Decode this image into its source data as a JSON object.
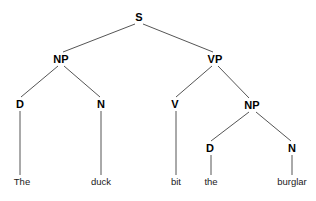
{
  "figure": {
    "kind": "constituency-parse-tree",
    "sentence": "The duck bit the burglar",
    "background_color": "#ffffff",
    "edge_color": "#555555",
    "node_text_color": "#000000",
    "leaf_text_color": "#1a1a1a"
  },
  "nodes": [
    {
      "id": "s",
      "label": "S",
      "x": 139,
      "y": 17
    },
    {
      "id": "np1",
      "label": "NP",
      "x": 61,
      "y": 59
    },
    {
      "id": "vp",
      "label": "VP",
      "x": 215,
      "y": 59
    },
    {
      "id": "d1",
      "label": "D",
      "x": 20,
      "y": 104
    },
    {
      "id": "n1",
      "label": "N",
      "x": 101,
      "y": 104
    },
    {
      "id": "v",
      "label": "V",
      "x": 175,
      "y": 104
    },
    {
      "id": "np2",
      "label": "NP",
      "x": 252,
      "y": 105
    },
    {
      "id": "d2",
      "label": "D",
      "x": 210,
      "y": 148
    },
    {
      "id": "n2",
      "label": "N",
      "x": 292,
      "y": 148
    }
  ],
  "leaves": [
    {
      "id": "leaf-the-1",
      "label": "The",
      "x": 22,
      "y": 182,
      "parent": "d1"
    },
    {
      "id": "leaf-duck",
      "label": "duck",
      "x": 101,
      "y": 182,
      "parent": "n1"
    },
    {
      "id": "leaf-bit",
      "label": "bit",
      "x": 176,
      "y": 182,
      "parent": "v"
    },
    {
      "id": "leaf-the-2",
      "label": "the",
      "x": 211,
      "y": 182,
      "parent": "d2"
    },
    {
      "id": "leaf-burglar",
      "label": "burglar",
      "x": 292,
      "y": 182,
      "parent": "n2"
    }
  ],
  "edges": [
    {
      "from": "s",
      "to": "np1",
      "x1": 135,
      "y1": 24,
      "x2": 63,
      "y2": 52
    },
    {
      "from": "s",
      "to": "vp",
      "x1": 143,
      "y1": 24,
      "x2": 213,
      "y2": 52
    },
    {
      "from": "np1",
      "to": "d1",
      "x1": 58,
      "y1": 66,
      "x2": 21,
      "y2": 97
    },
    {
      "from": "np1",
      "to": "n1",
      "x1": 64,
      "y1": 66,
      "x2": 100,
      "y2": 97
    },
    {
      "from": "vp",
      "to": "v",
      "x1": 212,
      "y1": 66,
      "x2": 176,
      "y2": 97
    },
    {
      "from": "vp",
      "to": "np2",
      "x1": 218,
      "y1": 66,
      "x2": 249,
      "y2": 98
    },
    {
      "from": "np2",
      "to": "d2",
      "x1": 249,
      "y1": 112,
      "x2": 211,
      "y2": 141
    },
    {
      "from": "np2",
      "to": "n2",
      "x1": 256,
      "y1": 112,
      "x2": 291,
      "y2": 141
    },
    {
      "from": "d1",
      "to": "leaf-the-1",
      "x1": 20,
      "y1": 111,
      "x2": 20,
      "y2": 175
    },
    {
      "from": "n1",
      "to": "leaf-duck",
      "x1": 101,
      "y1": 111,
      "x2": 101,
      "y2": 175
    },
    {
      "from": "v",
      "to": "leaf-bit",
      "x1": 176,
      "y1": 111,
      "x2": 176,
      "y2": 175
    },
    {
      "from": "d2",
      "to": "leaf-the-2",
      "x1": 211,
      "y1": 155,
      "x2": 211,
      "y2": 175
    },
    {
      "from": "n2",
      "to": "leaf-burglar",
      "x1": 292,
      "y1": 155,
      "x2": 292,
      "y2": 175
    }
  ]
}
